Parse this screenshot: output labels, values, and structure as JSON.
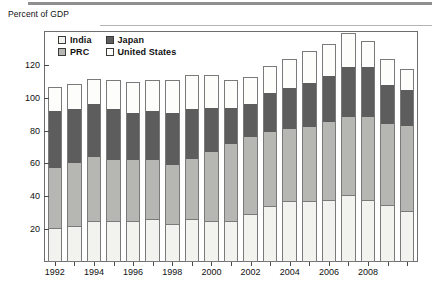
{
  "header": {
    "axis_title": "Percent of GDP"
  },
  "legend": {
    "position": "top-left-inside",
    "items": [
      {
        "label": "India",
        "key": "india",
        "color": "#f2f2ef"
      },
      {
        "label": "Japan",
        "key": "japan",
        "color": "#5d5d5d"
      },
      {
        "label": "PRC",
        "key": "prc",
        "color": "#b6b6b2"
      },
      {
        "label": "United States",
        "key": "united_states",
        "color": "#fdfdfc"
      }
    ]
  },
  "axes": {
    "y_ticks": [
      20,
      40,
      60,
      80,
      100,
      120
    ],
    "y_tick_labels": [
      "20",
      "40",
      "60",
      "80",
      "100",
      "120"
    ],
    "ylim": [
      0,
      140
    ],
    "x_tick_labels": [
      "1992",
      "1994",
      "1996",
      "1998",
      "2000",
      "2002",
      "2004",
      "2006",
      "2008"
    ],
    "x_tick_years": [
      1992,
      1994,
      1996,
      1998,
      2000,
      2002,
      2004,
      2006,
      2008
    ]
  },
  "chart_data": {
    "type": "bar",
    "subtype": "stacked-vertical",
    "title": "",
    "xlabel": "",
    "ylabel": "Percent of GDP",
    "ylim": [
      0,
      140
    ],
    "grid": false,
    "legend_position": "upper left (inside plot)",
    "categories": [
      "1992",
      "1993",
      "1994",
      "1995",
      "1996",
      "1997",
      "1998",
      "1999",
      "2000",
      "2001",
      "2002",
      "2003",
      "2004",
      "2005",
      "2006",
      "2007",
      "2008",
      "2009",
      "2010"
    ],
    "series": [
      {
        "name": "India",
        "color": "#f2f2ef",
        "values": [
          21,
          22,
          25,
          25,
          25,
          26,
          23,
          26,
          25,
          25,
          29,
          34,
          37,
          37,
          38,
          41,
          38,
          35,
          31
        ]
      },
      {
        "name": "PRC",
        "color": "#b6b6b2",
        "values": [
          36,
          38,
          39,
          37,
          37,
          36,
          36,
          37,
          42,
          47,
          47,
          45,
          44,
          45,
          47,
          47,
          50,
          49,
          52
        ]
      },
      {
        "name": "Japan",
        "color": "#5d5d5d",
        "values": [
          35,
          33,
          32,
          31,
          29,
          30,
          32,
          30,
          27,
          22,
          20,
          24,
          25,
          27,
          28,
          31,
          31,
          24,
          22
        ]
      },
      {
        "name": "United States",
        "color": "#fdfdfc",
        "values": [
          14,
          15,
          15,
          17,
          18,
          18,
          19,
          20,
          19,
          16,
          16,
          16,
          17,
          19,
          19,
          20,
          15,
          15,
          12
        ]
      }
    ],
    "totals": [
      106,
      108,
      111,
      110,
      109,
      110,
      110,
      113,
      113,
      110,
      112,
      119,
      123,
      128,
      132,
      139,
      134,
      123,
      117
    ]
  },
  "colors": {
    "india": "#f2f2ef",
    "prc": "#b6b6b2",
    "japan": "#5d5d5d",
    "united_states": "#fdfdfc",
    "frame": "#6e6e6e",
    "rule": "#8f8f8f"
  }
}
